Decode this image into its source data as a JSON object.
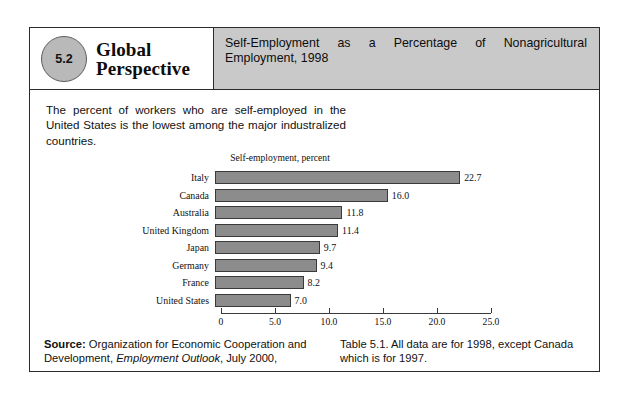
{
  "panel": {
    "badge_number": "5.2",
    "series_title_line1": "Global",
    "series_title_line2": "Perspective",
    "header_title": "Self-Employment as a Percentage of Nonagricultural Employment, 1998",
    "lead_paragraph": "The percent of workers who are self-employed in the United States is the lowest among the major industralized countries.",
    "source_label": "Source:",
    "source_text_a": " Organization for Economic Cooperation and Development, ",
    "source_italic": "Employment Outlook",
    "source_text_b": ", July 2000,",
    "note_text": "Table 5.1. All data are for 1998, except Canada which is for 1997."
  },
  "chart_data": {
    "type": "bar",
    "orientation": "horizontal",
    "title": "Self-employment, percent",
    "xlabel": "",
    "ylabel": "",
    "xlim": [
      0,
      25
    ],
    "grid": false,
    "legend": null,
    "bar_color": "#8c8c8c",
    "bar_border_color": "#3a3a3a",
    "categories": [
      "Italy",
      "Canada",
      "Australia",
      "United Kingdom",
      "Japan",
      "Germany",
      "France",
      "United States"
    ],
    "values": [
      22.7,
      16.0,
      11.8,
      11.4,
      9.7,
      9.4,
      8.2,
      7.0
    ],
    "value_labels": [
      "22.7",
      "16.0",
      "11.8",
      "11.4",
      "9.7",
      "9.4",
      "8.2",
      "7.0"
    ],
    "xticks": [
      0,
      5,
      10,
      15,
      20,
      25
    ],
    "xtick_labels": [
      "0",
      "5.0",
      "10.0",
      "15.0",
      "20.0",
      "25.0"
    ]
  }
}
